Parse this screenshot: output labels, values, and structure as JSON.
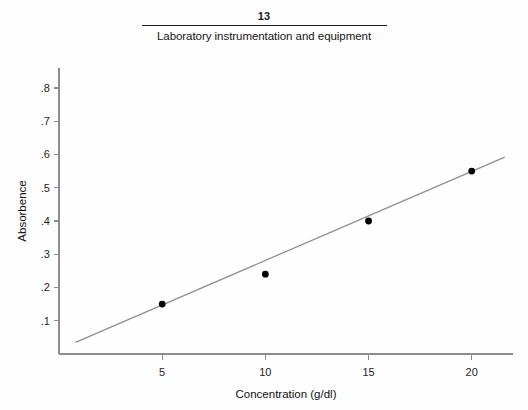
{
  "header": {
    "chapter_number": "13",
    "chapter_title": "Laboratory instrumentation and equipment"
  },
  "chart_data": {
    "type": "scatter",
    "title": "",
    "xlabel": "Concentration (g/dl)",
    "ylabel": "Absorbence",
    "x": [
      5,
      10,
      15,
      20
    ],
    "values": [
      0.15,
      0.24,
      0.4,
      0.55
    ],
    "series": [
      {
        "name": "Absorbence readings",
        "x": [
          5,
          10,
          15,
          20
        ],
        "values": [
          0.15,
          0.24,
          0.4,
          0.55
        ]
      }
    ],
    "trendline": {
      "type": "linear",
      "x_start": 0.8,
      "y_start": 0.035,
      "x_end": 21.6,
      "y_end": 0.592
    },
    "xlim": [
      0,
      22
    ],
    "ylim": [
      0,
      0.86
    ],
    "xticks": [
      5,
      10,
      15,
      20
    ],
    "xtick_labels": [
      "5",
      "10",
      "15",
      "20"
    ],
    "yticks": [
      0.1,
      0.2,
      0.3,
      0.4,
      0.5,
      0.6,
      0.7,
      0.8
    ],
    "ytick_labels": [
      ".1",
      ".2",
      ".3",
      ".4",
      ".5",
      ".6",
      ".7",
      ".8"
    ],
    "grid": false,
    "legend": "none",
    "marker_color": "#000000",
    "line_color": "#8f8f8f",
    "axis_color": "#8d8d8d"
  }
}
